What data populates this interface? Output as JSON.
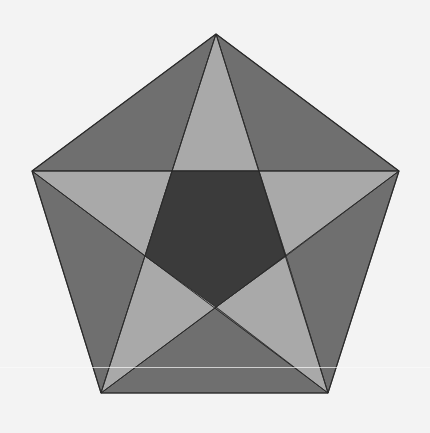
{
  "figure": {
    "colors": {
      "background": "#f3f3f3",
      "outer_triangles": "#6f6f6f",
      "star_points": "#a9a9a9",
      "inner_pentagon": "#3b3b3b",
      "stroke": "#2a2a2a"
    },
    "outer_vertices": [
      [
        216,
        34
      ],
      [
        399,
        171
      ],
      [
        328,
        393
      ],
      [
        101,
        393
      ],
      [
        32,
        171
      ]
    ],
    "inner_vertices": [
      [
        259,
        171
      ],
      [
        286,
        256
      ],
      [
        216,
        307
      ],
      [
        145,
        256
      ],
      [
        172,
        171
      ]
    ],
    "scanline_y": 367
  }
}
